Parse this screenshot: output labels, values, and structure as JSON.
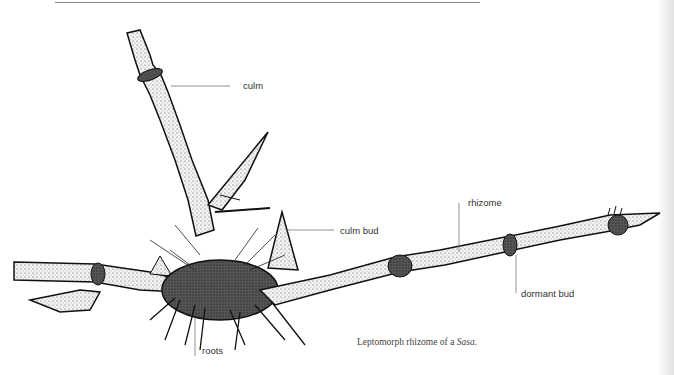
{
  "figure": {
    "title": "Leptomorph rhizome of a Sasa",
    "caption": {
      "prefix": "Leptomorph rhizome of a ",
      "italic": "Sasa",
      "suffix": "."
    },
    "labels": {
      "culm": "culm",
      "culm_bud": "culm bud",
      "rhizome": "rhizome",
      "dormant_bud": "dormant bud",
      "roots": "roots"
    }
  },
  "colors": {
    "ink": "#111111",
    "leader": "#777777",
    "text": "#333333",
    "rule": "#8a8a8a"
  }
}
